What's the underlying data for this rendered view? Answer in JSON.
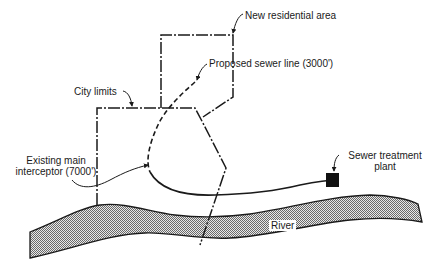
{
  "diagram": {
    "labels": {
      "new_residential_area": "New residential area",
      "proposed_sewer_line": "Proposed sewer line (3000')",
      "city_limits": "City limits",
      "existing_interceptor_line1": "Existing main",
      "existing_interceptor_line2": "interceptor (7000')",
      "treatment_plant_line1": "Sewer treatment",
      "treatment_plant_line2": "plant",
      "river": "River"
    },
    "colors": {
      "line": "#1a1a1a",
      "river_fill": "#9a9a9a",
      "plant": "#111111"
    }
  }
}
